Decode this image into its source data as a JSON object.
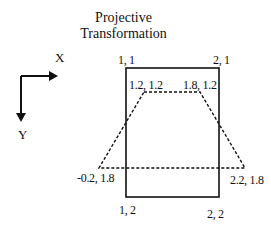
{
  "title": {
    "line1": "Projective",
    "line2": "Transformation"
  },
  "axes": {
    "x_label": "X",
    "y_label": "Y"
  },
  "source_square": {
    "style": "solid",
    "corners": [
      {
        "label": "1, 1"
      },
      {
        "label": "2, 1"
      },
      {
        "label": "1, 2"
      },
      {
        "label": "2, 2"
      }
    ]
  },
  "projected_quad": {
    "style": "dashed",
    "corners": [
      {
        "label": "1.2, 1.2"
      },
      {
        "label": "1.8, 1.2"
      },
      {
        "label": "-0.2, 1.8"
      },
      {
        "label": "2.2, 1.8"
      }
    ]
  },
  "colors": {
    "stroke": "#111111",
    "background": "#ffffff"
  }
}
